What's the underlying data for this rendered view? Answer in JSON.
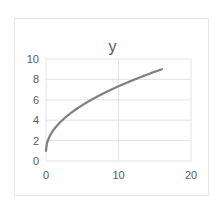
{
  "chart_data": {
    "type": "line",
    "title": "y",
    "xlabel": "",
    "ylabel": "",
    "xlim": [
      0,
      20
    ],
    "ylim": [
      0,
      10
    ],
    "x_ticks": [
      "0",
      "10",
      "20"
    ],
    "y_ticks": [
      "0",
      "2",
      "4",
      "6",
      "8",
      "10"
    ],
    "grid": true,
    "legend": null,
    "series": [
      {
        "name": "y",
        "color": "#7f7f7f",
        "x": [
          0,
          0.25,
          0.5,
          1,
          2,
          3,
          4,
          5,
          6,
          8,
          10,
          12,
          14,
          16
        ],
        "values": [
          1,
          2,
          2.41,
          3,
          3.83,
          4.46,
          5,
          5.47,
          5.9,
          6.66,
          7.32,
          7.93,
          8.48,
          9
        ]
      }
    ]
  }
}
